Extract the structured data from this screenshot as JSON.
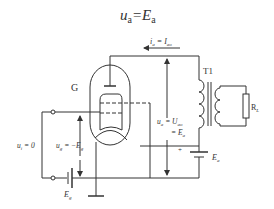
{
  "title": {
    "main": "u",
    "sub": "a",
    "eq": "=E",
    "sub2": "a"
  },
  "labels": {
    "current": {
      "i": "i",
      "i_sub": "a",
      "eq": " = I",
      "eq_sub": "ao"
    },
    "tube": "G",
    "transformer": "T1",
    "load": {
      "r": "R",
      "r_sub": "L"
    },
    "anode_voltage": {
      "u": "u",
      "u_sub": "a",
      "eq1": " = U",
      "eq1_sub": "ao",
      "eq2": "= E",
      "eq2_sub": "a"
    },
    "input_voltage": {
      "u": "u",
      "u_sub": "i",
      "eq": " = 0"
    },
    "grid_voltage": {
      "u": "u",
      "u_sub": "g",
      "eq": " = −E",
      "eq_sub": "g"
    },
    "grid_battery": {
      "e": "E",
      "e_sub": "g"
    },
    "anode_battery": {
      "e": "E",
      "e_sub": "a"
    },
    "plus": "+"
  },
  "colors": {
    "line": "#333333",
    "background": "#ffffff"
  }
}
